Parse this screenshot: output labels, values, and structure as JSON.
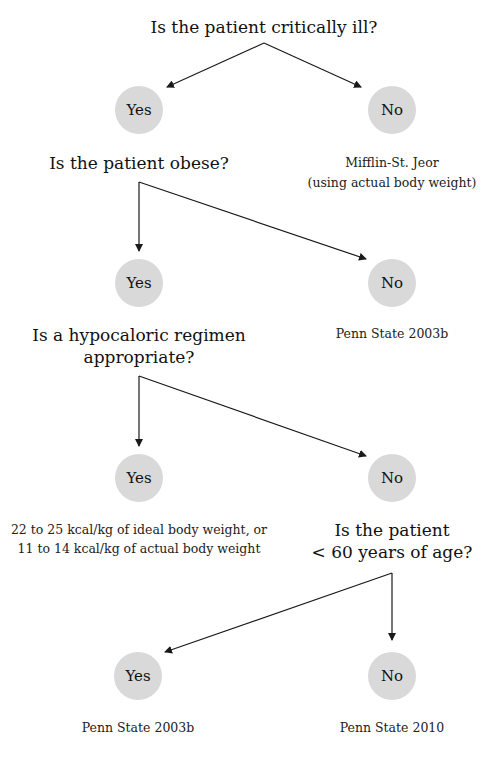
{
  "flowchart": {
    "q1": {
      "text": "Is the patient critically ill?"
    },
    "q1_yes": "Yes",
    "q1_no": "No",
    "q1_no_result": [
      "Mifflin-St. Jeor",
      "(using actual body weight)"
    ],
    "q2": {
      "text": "Is the patient obese?"
    },
    "q2_yes": "Yes",
    "q2_no": "No",
    "q2_no_result": "Penn State 2003b",
    "q3": {
      "lines": [
        "Is a hypocaloric regimen",
        "appropriate?"
      ]
    },
    "q3_yes": "Yes",
    "q3_no": "No",
    "q3_yes_result": [
      "22 to 25 kcal/kg of ideal body weight, or",
      "11 to 14 kcal/kg of actual body weight"
    ],
    "q4": {
      "lines": [
        "Is the patient",
        "< 60 years of age?"
      ]
    },
    "q4_yes": "Yes",
    "q4_no": "No",
    "q4_yes_result": "Penn State 2003b",
    "q4_no_result": "Penn State 2010"
  },
  "colors": {
    "node_fill": "#d9d9d9",
    "line": "#1a1a1a"
  }
}
